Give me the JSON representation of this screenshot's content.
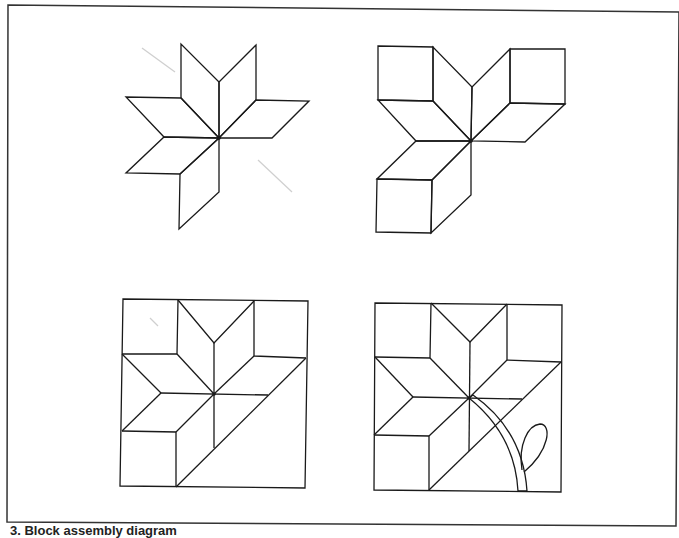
{
  "figure": {
    "caption": "3. Block assembly diagram",
    "panels": [
      {
        "id": "star",
        "label": "Eight-point star"
      },
      {
        "id": "star-with-squares",
        "label": "Star with corner squares"
      },
      {
        "id": "pieced-block",
        "label": "Pieced block"
      },
      {
        "id": "appliqued-block",
        "label": "Block with stem and leaf"
      }
    ],
    "colors": {
      "line": "#1a1a1a",
      "background": "#ffffff",
      "frame": "#333333"
    }
  }
}
